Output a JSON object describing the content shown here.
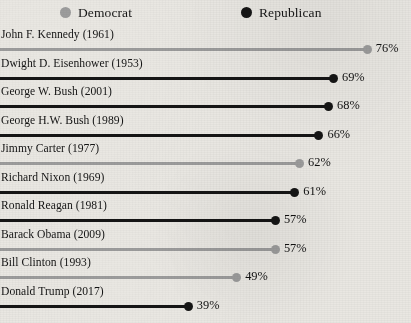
{
  "legend": {
    "items": [
      {
        "label": "Democrat",
        "party": "dem",
        "color": "#9c9c9c",
        "icon": "circle-icon"
      },
      {
        "label": "Republican",
        "party": "rep",
        "color": "#151515",
        "icon": "circle-icon"
      }
    ]
  },
  "chart_data": {
    "type": "bar",
    "subtype": "lollipop-horizontal",
    "title": "",
    "subtitle": "",
    "xlabel": "",
    "ylabel": "",
    "xlim": [
      0,
      80
    ],
    "grid": false,
    "legend_position": "top",
    "value_suffix": "%",
    "categories": [
      "John F. Kennedy (1961)",
      "Dwight D. Eisenhower (1953)",
      "George W. Bush (2001)",
      "George H.W. Bush (1989)",
      "Jimmy Carter (1977)",
      "Richard Nixon (1969)",
      "Ronald Reagan (1981)",
      "Barack Obama (2009)",
      "Bill Clinton (1993)",
      "Donald Trump (2017)"
    ],
    "values": [
      76,
      69,
      68,
      66,
      62,
      61,
      57,
      57,
      49,
      39
    ],
    "value_labels": [
      "76%",
      "69%",
      "68%",
      "66%",
      "62%",
      "61%",
      "57%",
      "57%",
      "49%",
      "39%"
    ],
    "groups": [
      "dem",
      "rep",
      "rep",
      "rep",
      "dem",
      "rep",
      "rep",
      "dem",
      "dem",
      "rep"
    ],
    "series": [
      {
        "name": "Democrat",
        "color": "#9c9c9c",
        "points": [
          {
            "category": "John F. Kennedy (1961)",
            "value": 76,
            "label": "76%"
          },
          {
            "category": "Jimmy Carter (1977)",
            "value": 62,
            "label": "62%"
          },
          {
            "category": "Barack Obama (2009)",
            "value": 57,
            "label": "57%"
          },
          {
            "category": "Bill Clinton (1993)",
            "value": 49,
            "label": "49%"
          }
        ]
      },
      {
        "name": "Republican",
        "color": "#151515",
        "points": [
          {
            "category": "Dwight D. Eisenhower (1953)",
            "value": 69,
            "label": "69%"
          },
          {
            "category": "George W. Bush (2001)",
            "value": 68,
            "label": "68%"
          },
          {
            "category": "George H.W. Bush (1989)",
            "value": 66,
            "label": "66%"
          },
          {
            "category": "Richard Nixon (1969)",
            "value": 61,
            "label": "61%"
          },
          {
            "category": "Ronald Reagan (1981)",
            "value": 57,
            "label": "57%"
          },
          {
            "category": "Donald Trump (2017)",
            "value": 39,
            "label": "39%"
          }
        ]
      }
    ]
  }
}
